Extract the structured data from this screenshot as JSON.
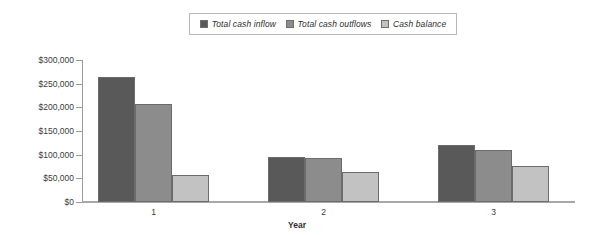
{
  "chart_data": {
    "type": "bar",
    "title": "",
    "xlabel": "Year",
    "ylabel": "",
    "categories": [
      "1",
      "2",
      "3"
    ],
    "ytick_labels": [
      "$300,000",
      "$250,000",
      "$200,000",
      "$150,000",
      "$100,000",
      "$50,000",
      "$0"
    ],
    "ytick_values": [
      300000,
      250000,
      200000,
      150000,
      100000,
      50000,
      0
    ],
    "ylim": [
      0,
      300000
    ],
    "grid": false,
    "legend_position": "top-center",
    "series": [
      {
        "name": "Total cash inflow",
        "color": "#595959",
        "values": [
          265000,
          96000,
          120000
        ]
      },
      {
        "name": "Total cash outflows",
        "color": "#8c8c8c",
        "values": [
          207000,
          92000,
          110000
        ]
      },
      {
        "name": "Cash balance",
        "color": "#c2c2c2",
        "values": [
          58000,
          64000,
          77000
        ]
      }
    ]
  },
  "legend": {
    "items": [
      {
        "label": "Total cash inflow",
        "color": "#595959"
      },
      {
        "label": "Total cash outflows",
        "color": "#8c8c8c"
      },
      {
        "label": "Cash balance",
        "color": "#c2c2c2"
      }
    ]
  },
  "axes": {
    "x_title": "Year",
    "x_labels": [
      "1",
      "2",
      "3"
    ],
    "y_labels": [
      "$300,000",
      "$250,000",
      "$200,000",
      "$150,000",
      "$100,000",
      "$50,000",
      "$0"
    ]
  }
}
